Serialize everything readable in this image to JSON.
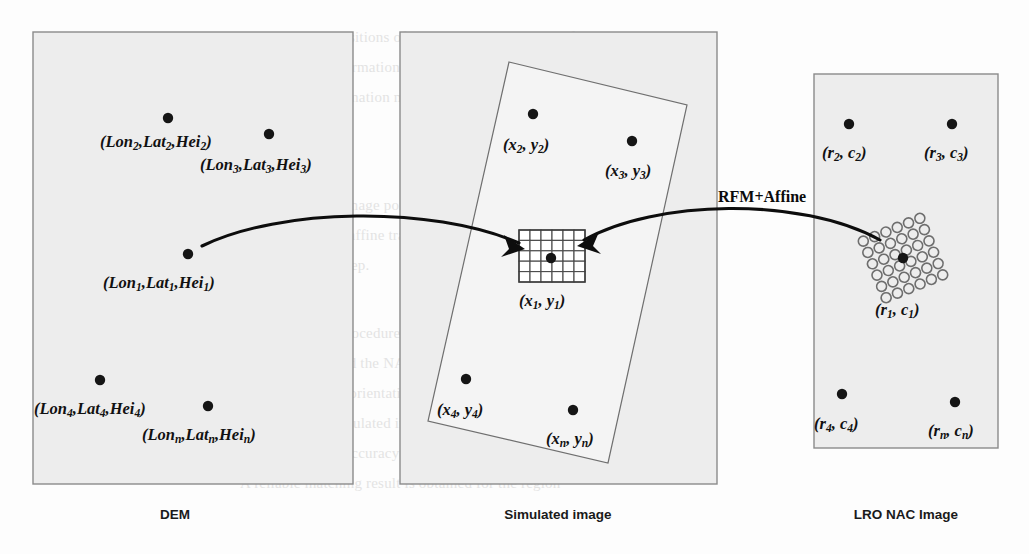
{
  "figure": {
    "transform_label": "RFM+Affine"
  },
  "panels": [
    {
      "id": "dem",
      "caption": "DEM",
      "caption_x": 175,
      "caption_y": 519,
      "rect": {
        "x": 33,
        "y": 32,
        "w": 320,
        "h": 452
      },
      "points": [
        {
          "name": "p2",
          "cx": 168,
          "cy": 118,
          "label_x": 100,
          "label_y": 147,
          "head": "Lon",
          "sub1": "2",
          "mid1": ",Lat",
          "sub2": "2",
          "mid2": ",Hei",
          "sub3": "2"
        },
        {
          "name": "p3",
          "cx": 269,
          "cy": 134,
          "label_x": 200,
          "label_y": 170,
          "head": "Lon",
          "sub1": "3",
          "mid1": ",Lat",
          "sub2": "3",
          "mid2": ",Hei",
          "sub3": "3"
        },
        {
          "name": "p1",
          "cx": 188,
          "cy": 254,
          "label_x": 103,
          "label_y": 288,
          "head": "Lon",
          "sub1": "1",
          "mid1": ",Lat",
          "sub2": "1",
          "mid2": ",Hei",
          "sub3": "1"
        },
        {
          "name": "p4",
          "cx": 100,
          "cy": 380,
          "label_x": 34,
          "label_y": 414,
          "head": "Lon",
          "sub1": "4",
          "mid1": ",Lat",
          "sub2": "4",
          "mid2": ",Hei",
          "sub3": "4"
        },
        {
          "name": "pn",
          "cx": 208,
          "cy": 406,
          "label_x": 142,
          "label_y": 440,
          "head": "Lon",
          "sub1": "n",
          "mid1": ",Lat",
          "sub2": "n",
          "mid2": ",Hei",
          "sub3": "n"
        }
      ]
    },
    {
      "id": "simulated",
      "caption": "Simulated image",
      "caption_x": 558,
      "caption_y": 519,
      "rect": {
        "x": 400,
        "y": 32,
        "w": 317,
        "h": 452
      },
      "quad": "509,62 687,105 608,463 428,421",
      "grid": {
        "x": 519,
        "y": 230,
        "w": 66,
        "h": 52,
        "cols": 6,
        "rows": 5
      },
      "points": [
        {
          "name": "x2",
          "cx": 533,
          "cy": 114,
          "label_x": 503,
          "label_y": 150,
          "head": "x",
          "sub1": "2",
          "mid1": ", y",
          "sub2": "2"
        },
        {
          "name": "x3",
          "cx": 632,
          "cy": 141,
          "label_x": 605,
          "label_y": 176,
          "head": "x",
          "sub1": "3",
          "mid1": ", y",
          "sub2": "3"
        },
        {
          "name": "x1",
          "cx": 551,
          "cy": 258,
          "label_x": 519,
          "label_y": 306,
          "head": "x",
          "sub1": "1",
          "mid1": ", y",
          "sub2": "1"
        },
        {
          "name": "x4",
          "cx": 466,
          "cy": 379,
          "label_x": 437,
          "label_y": 415,
          "head": "x",
          "sub1": "4",
          "mid1": ", y",
          "sub2": "4"
        },
        {
          "name": "xn",
          "cx": 573,
          "cy": 410,
          "label_x": 546,
          "label_y": 444,
          "head": "x",
          "sub1": "n",
          "mid1": ", y",
          "sub2": "n"
        }
      ]
    },
    {
      "id": "nac",
      "caption": "LRO NAC Image",
      "caption_x": 906,
      "caption_y": 519,
      "rect": {
        "x": 814,
        "y": 74,
        "w": 184,
        "h": 374
      },
      "circle_cluster": {
        "center_x": 903,
        "center_y": 258,
        "cols": 6,
        "rows": 6,
        "spacing": 12.2,
        "radius": 5.0,
        "rotation_deg": -22
      },
      "points": [
        {
          "name": "r2",
          "cx": 849,
          "cy": 124,
          "label_x": 822,
          "label_y": 158,
          "head": "r",
          "sub1": "2",
          "mid1": ", c",
          "sub2": "2"
        },
        {
          "name": "r3",
          "cx": 952,
          "cy": 124,
          "label_x": 924,
          "label_y": 158,
          "head": "r",
          "sub1": "3",
          "mid1": ", c",
          "sub2": "3"
        },
        {
          "name": "r1",
          "cx": 903,
          "cy": 258,
          "label_x": 875,
          "label_y": 315,
          "head": "r",
          "sub1": "1",
          "mid1": ", c",
          "sub2": "1"
        },
        {
          "name": "r4",
          "cx": 842,
          "cy": 394,
          "label_x": 814,
          "label_y": 429,
          "head": "r",
          "sub1": "4",
          "mid1": ", c",
          "sub2": "4"
        },
        {
          "name": "rn",
          "cx": 955,
          "cy": 402,
          "label_x": 928,
          "label_y": 436,
          "head": "r",
          "sub1": "n",
          "mid1": ", c",
          "sub2": "n"
        }
      ]
    }
  ],
  "arrows": [
    {
      "name": "dem-to-simulated",
      "path": "M 202,246 C 280,208 430,205 519,243",
      "head": "525,249 504,235 509,249 501,257",
      "label": ""
    },
    {
      "name": "simulated-to-nac",
      "path": "M 880,240 C 800,196 655,200 584,240",
      "head": "577,246 599,232 593,246 601,254",
      "label": "RFM+Affine",
      "label_x": 718,
      "label_y": 202
    }
  ],
  "background_bleed": [
    {
      "text": "where  and  are the positions of     ,  and    are the  parameters of",
      "x": 220,
      "y": 22
    },
    {
      "text": "the affine transformation, and  ,  ,  are the affine parameters of the",
      "x": 246,
      "y": 52
    },
    {
      "text": "the affine transformation model",
      "x": 236,
      "y": 82
    },
    {
      "text": "The corresponding  image  points  are  computed  from  the  simulated",
      "x": 222,
      "y": 190
    },
    {
      "text": "image by RFM with affine  transformation  parameters  obtained  in  the",
      "x": 220,
      "y": 220
    },
    {
      "text": "previous  matching  step.",
      "x": 222,
      "y": 250
    },
    {
      "text": "Through  the  above  procedure,  a  set  of  control  points  is  generated",
      "x": 218,
      "y": 318
    },
    {
      "text": "between the DEM and the NAC image.  The control points are then used",
      "x": 218,
      "y": 348
    },
    {
      "text": "to   refine   the   exterior   orientation   parameters   of   the   NAC",
      "x": 218,
      "y": 378
    },
    {
      "text": "images.  Since  the  simulated  image  geometry  reduces  the  searching",
      "x": 218,
      "y": 408
    },
    {
      "text": "space,  the  matching  accuracy  is  improved  as  illustrated  below.",
      "x": 218,
      "y": 438
    },
    {
      "text": "A  reliable  matching  result  is  obtained  for  the  region",
      "x": 240,
      "y": 468
    }
  ]
}
